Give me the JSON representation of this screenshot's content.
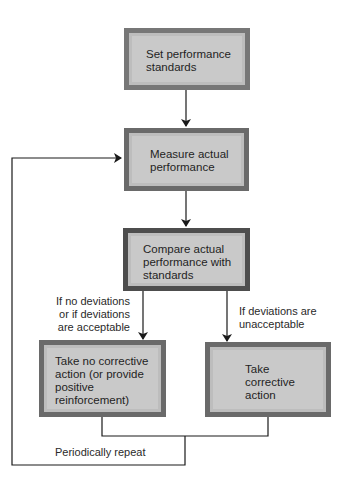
{
  "diagram": {
    "type": "flowchart",
    "nodes": [
      {
        "id": "set-standards",
        "label_lines": [
          "Set performance",
          "standards"
        ]
      },
      {
        "id": "measure",
        "label_lines": [
          "Measure actual",
          "performance"
        ]
      },
      {
        "id": "compare",
        "label_lines": [
          "Compare actual",
          "performance with",
          "standards"
        ]
      },
      {
        "id": "no-action",
        "label_lines": [
          "Take no corrective",
          "action (or provide",
          "positive",
          "reinforcement)"
        ]
      },
      {
        "id": "corrective",
        "label_lines": [
          "Take",
          "corrective",
          "action"
        ]
      }
    ],
    "edge_labels": {
      "acceptable": [
        "If no deviations",
        "or if deviations",
        "are acceptable"
      ],
      "unacceptable": [
        "If deviations are",
        "unacceptable"
      ],
      "loop": "Periodically repeat"
    },
    "edges": [
      {
        "from": "set-standards",
        "to": "measure"
      },
      {
        "from": "measure",
        "to": "compare"
      },
      {
        "from": "compare",
        "to": "no-action",
        "label": "If no deviations or if deviations are acceptable"
      },
      {
        "from": "compare",
        "to": "corrective",
        "label": "If deviations are unacceptable"
      },
      {
        "from": "no-action",
        "to": "measure",
        "label": "Periodically repeat"
      },
      {
        "from": "corrective",
        "to": "measure",
        "label": "Periodically repeat"
      }
    ]
  }
}
